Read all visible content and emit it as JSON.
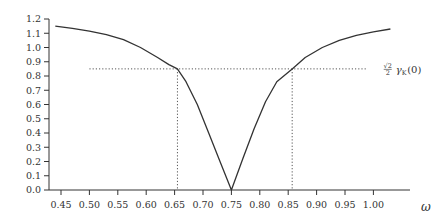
{
  "chart_data": {
    "type": "line",
    "title": "",
    "xlabel": "ω",
    "ylabel": "",
    "xlim": [
      0.43,
      1.03
    ],
    "ylim": [
      0.0,
      1.2
    ],
    "grid": false,
    "legend": null,
    "x_ticks": [
      "0.45",
      "0.50",
      "0.55",
      "0.60",
      "0.65",
      "0.70",
      "0.75",
      "0.80",
      "0.85",
      "0.90",
      "0.95",
      "1.00"
    ],
    "y_ticks": [
      "0.0",
      "0.1",
      "0.2",
      "0.3",
      "0.4",
      "0.5",
      "0.6",
      "0.7",
      "0.8",
      "0.9",
      "1.0",
      "1.1",
      "1.2"
    ],
    "series": [
      {
        "name": "gamma_K(omega)",
        "color": "#333333",
        "x": [
          0.44,
          0.47,
          0.5,
          0.53,
          0.56,
          0.59,
          0.62,
          0.64,
          0.655,
          0.67,
          0.69,
          0.71,
          0.73,
          0.75,
          0.77,
          0.79,
          0.81,
          0.83,
          0.857,
          0.88,
          0.91,
          0.94,
          0.97,
          1.0,
          1.03
        ],
        "y": [
          1.15,
          1.135,
          1.115,
          1.09,
          1.055,
          1.0,
          0.93,
          0.88,
          0.85,
          0.76,
          0.6,
          0.4,
          0.2,
          0.0,
          0.22,
          0.43,
          0.62,
          0.76,
          0.85,
          0.93,
          1.0,
          1.05,
          1.085,
          1.11,
          1.13
        ]
      }
    ],
    "annotations": [
      {
        "type": "hline",
        "style": "dotted",
        "y": 0.85,
        "x_from": 0.5,
        "x_to": 0.99,
        "label_parts": {
          "coef_num": "√2",
          "coef_den": "2",
          "symbol": "γ",
          "subscript": "K",
          "arg": "(0)"
        }
      },
      {
        "type": "vline",
        "style": "dotted",
        "x": 0.655,
        "y_from": 0.0,
        "y_to": 0.85
      },
      {
        "type": "vline",
        "style": "dotted",
        "x": 0.857,
        "y_from": 0.0,
        "y_to": 0.85
      }
    ]
  },
  "layout": {
    "axis_color": "#333333",
    "dotted_color": "#555555"
  }
}
